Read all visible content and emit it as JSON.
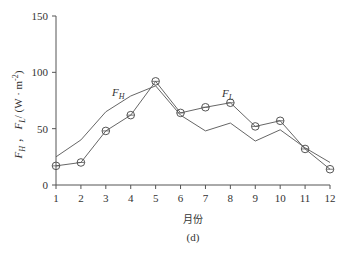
{
  "chart_data": {
    "type": "line",
    "title": "",
    "caption": "(d)",
    "xlabel": "月份",
    "ylabel": "F_H , F_L /（W · m^-2）",
    "ylabel_display": {
      "part1": "F",
      "sub1": "H",
      "sep": "，",
      "part2": "F",
      "sub2": "L",
      "unit": "/ (W · m",
      "unit_exp": "-2",
      "close": ")"
    },
    "x": [
      1,
      2,
      3,
      4,
      5,
      6,
      7,
      8,
      9,
      10,
      11,
      12
    ],
    "xticks": [
      "1",
      "2",
      "3",
      "4",
      "5",
      "6",
      "7",
      "8",
      "9",
      "10",
      "11",
      "12"
    ],
    "yticks": [
      "0",
      "50",
      "100",
      "150"
    ],
    "ylim": [
      0,
      150
    ],
    "xlim": [
      1,
      12
    ],
    "grid": false,
    "series": [
      {
        "name": "F_H",
        "label": "F",
        "label_sub": "H",
        "marker": "none",
        "values": [
          25,
          40,
          65,
          79,
          88,
          62,
          48,
          55,
          39,
          49,
          33,
          20
        ]
      },
      {
        "name": "F_L",
        "label": "F",
        "label_sub": "L",
        "marker": "circle",
        "values": [
          17,
          20,
          48,
          62,
          92,
          64,
          69,
          73,
          52,
          57,
          32,
          14
        ]
      }
    ],
    "annotations": [
      {
        "text": "F_H",
        "near_x": 4,
        "near_y": 84
      },
      {
        "text": "F_L",
        "near_x": 8,
        "near_y": 80
      }
    ]
  }
}
